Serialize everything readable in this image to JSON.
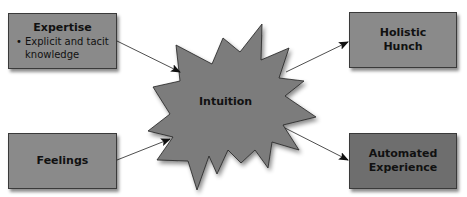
{
  "diagram": {
    "inputs": [
      {
        "title": "Expertise",
        "bullets": [
          {
            "line1": "Explicit and tacit",
            "line2": "knowledge"
          }
        ]
      },
      {
        "title": "Feelings"
      }
    ],
    "center": {
      "label": "Intuition"
    },
    "outputs": [
      {
        "title_line1": "Holistic",
        "title_line2": "Hunch"
      },
      {
        "title_line1": "Automated",
        "title_line2": "Experience"
      }
    ],
    "colors": {
      "box_fill": "#8a8a8a",
      "box_dark_fill": "#6e6e6e",
      "starburst_fill": "#7b7b7b",
      "stroke": "#222222"
    }
  }
}
